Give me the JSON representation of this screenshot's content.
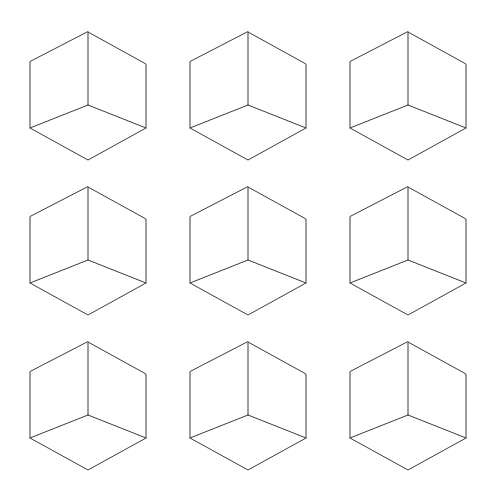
{
  "figure": {
    "type": "line-drawing",
    "background_color": "#ffffff",
    "stroke_color": "#3b3b3b",
    "fill_color": "#ffffff",
    "stroke_width": 1,
    "canvas": {
      "width": 480,
      "height": 492
    }
  },
  "grid": {
    "rows": 3,
    "columns": 3,
    "count": 9,
    "column_centers_x": [
      88,
      248,
      408
    ],
    "row_centers_y": [
      96,
      251,
      406
    ],
    "column_spacing": 160,
    "row_spacing": 155
  },
  "cube_geometry": {
    "description": "Isometric wireframe cube (Necker cube): hexagonal silhouette with an internal Y junction formed by the vertical front edge and two receding edges.",
    "half_width": 58,
    "half_height": 64,
    "side_vertical_half": 33,
    "center_junction_dy": 9,
    "vertices": {
      "top": [
        0,
        -64
      ],
      "upper_left": [
        -58,
        -34
      ],
      "upper_right": [
        58,
        -32
      ],
      "lower_left": [
        -58,
        32
      ],
      "lower_right": [
        58,
        32
      ],
      "bottom": [
        0,
        64
      ],
      "center": [
        0,
        9
      ]
    },
    "edges": [
      "top-upper_left",
      "top-upper_right",
      "upper_left-lower_left",
      "upper_right-lower_right",
      "lower_left-bottom",
      "lower_right-bottom",
      "top-center",
      "center-lower_left",
      "center-lower_right"
    ]
  },
  "cubes": [
    {
      "id": "cube-r1c1",
      "row": 1,
      "column": 1,
      "cx": 88,
      "cy": 96
    },
    {
      "id": "cube-r1c2",
      "row": 1,
      "column": 2,
      "cx": 248,
      "cy": 96
    },
    {
      "id": "cube-r1c3",
      "row": 1,
      "column": 3,
      "cx": 408,
      "cy": 96
    },
    {
      "id": "cube-r2c1",
      "row": 2,
      "column": 1,
      "cx": 88,
      "cy": 251
    },
    {
      "id": "cube-r2c2",
      "row": 2,
      "column": 2,
      "cx": 248,
      "cy": 251
    },
    {
      "id": "cube-r2c3",
      "row": 2,
      "column": 3,
      "cx": 408,
      "cy": 251
    },
    {
      "id": "cube-r3c1",
      "row": 3,
      "column": 1,
      "cx": 88,
      "cy": 406
    },
    {
      "id": "cube-r3c2",
      "row": 3,
      "column": 2,
      "cx": 248,
      "cy": 406
    },
    {
      "id": "cube-r3c3",
      "row": 3,
      "column": 3,
      "cx": 408,
      "cy": 406
    }
  ]
}
